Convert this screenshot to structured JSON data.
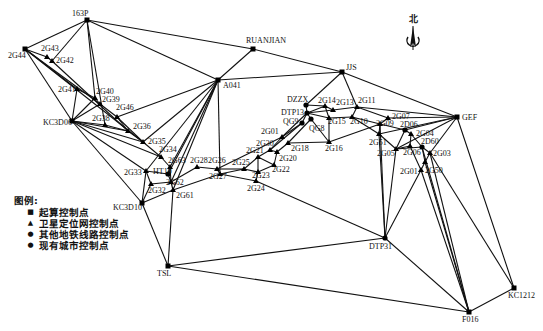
{
  "north_label": "北",
  "legend": {
    "title": "图例:",
    "items": [
      {
        "symbol": "■",
        "label": "起算控制点"
      },
      {
        "symbol": "▲",
        "label": "卫星定位网控制点"
      },
      {
        "symbol": "●",
        "label": "其他地铁线路控制点"
      },
      {
        "symbol": "●",
        "label": "现有城市控制点"
      }
    ]
  },
  "nodes": [
    {
      "id": "163P",
      "x": 87,
      "y": 20,
      "lx": 72,
      "ly": 16,
      "shape": "square"
    },
    {
      "id": "2G44",
      "x": 25,
      "y": 49,
      "lx": 8,
      "ly": 58,
      "shape": "square"
    },
    {
      "id": "2G43",
      "x": 47,
      "y": 57,
      "lx": 41,
      "ly": 51,
      "shape": "triangle"
    },
    {
      "id": "2G42",
      "x": 52,
      "y": 61,
      "lx": 56,
      "ly": 63,
      "shape": "triangle"
    },
    {
      "id": "RUANJIAN",
      "x": 253,
      "y": 49,
      "lx": 246,
      "ly": 43,
      "shape": "square"
    },
    {
      "id": "JJS",
      "x": 342,
      "y": 72,
      "lx": 346,
      "ly": 70,
      "shape": "square"
    },
    {
      "id": "A041",
      "x": 218,
      "y": 80,
      "lx": 223,
      "ly": 88,
      "shape": "square"
    },
    {
      "id": "2G41",
      "x": 77,
      "y": 89,
      "lx": 58,
      "ly": 92,
      "shape": "triangle"
    },
    {
      "id": "2G40",
      "x": 95,
      "y": 98,
      "lx": 96,
      "ly": 94,
      "shape": "triangle"
    },
    {
      "id": "2G39",
      "x": 100,
      "y": 104,
      "lx": 102,
      "ly": 102,
      "shape": "triangle"
    },
    {
      "id": "2G46",
      "x": 117,
      "y": 117,
      "lx": 116,
      "ly": 110,
      "shape": "triangle"
    },
    {
      "id": "KC3D06",
      "x": 72,
      "y": 121,
      "lx": 43,
      "ly": 125,
      "shape": "square"
    },
    {
      "id": "2G38",
      "x": 105,
      "y": 125,
      "lx": 92,
      "ly": 121,
      "shape": "triangle"
    },
    {
      "id": "2G36",
      "x": 128,
      "y": 131,
      "lx": 133,
      "ly": 129,
      "shape": "triangle"
    },
    {
      "id": "2G35",
      "x": 143,
      "y": 142,
      "lx": 148,
      "ly": 144,
      "shape": "triangle"
    },
    {
      "id": "2G34",
      "x": 161,
      "y": 157,
      "lx": 159,
      "ly": 152,
      "shape": "triangle"
    },
    {
      "id": "2G63",
      "x": 170,
      "y": 167,
      "lx": 168,
      "ly": 163,
      "shape": "triangle"
    },
    {
      "id": "2G28",
      "x": 197,
      "y": 167,
      "lx": 190,
      "ly": 163,
      "shape": "triangle"
    },
    {
      "id": "2G26",
      "x": 217,
      "y": 169,
      "lx": 208,
      "ly": 163,
      "shape": "triangle"
    },
    {
      "id": "2G33",
      "x": 146,
      "y": 171,
      "lx": 124,
      "ly": 175,
      "shape": "triangle"
    },
    {
      "id": "HT10",
      "x": 168,
      "y": 174,
      "lx": 153,
      "ly": 174,
      "shape": "circle"
    },
    {
      "id": "2G27",
      "x": 220,
      "y": 174,
      "lx": 209,
      "ly": 179,
      "shape": "triangle"
    },
    {
      "id": "2G62",
      "x": 171,
      "y": 182,
      "lx": 166,
      "ly": 185,
      "shape": "triangle"
    },
    {
      "id": "2G32",
      "x": 151,
      "y": 184,
      "lx": 148,
      "ly": 193,
      "shape": "triangle"
    },
    {
      "id": "2G61",
      "x": 173,
      "y": 190,
      "lx": 176,
      "ly": 198,
      "shape": "triangle"
    },
    {
      "id": "KC3D10",
      "x": 142,
      "y": 203,
      "lx": 113,
      "ly": 210,
      "shape": "square"
    },
    {
      "id": "2G25",
      "x": 244,
      "y": 169,
      "lx": 232,
      "ly": 165,
      "shape": "triangle"
    },
    {
      "id": "2G21",
      "x": 258,
      "y": 157,
      "lx": 246,
      "ly": 153,
      "shape": "triangle"
    },
    {
      "id": "2G30",
      "x": 270,
      "y": 150,
      "lx": 256,
      "ly": 146,
      "shape": "triangle"
    },
    {
      "id": "2G01",
      "x": 282,
      "y": 137,
      "lx": 261,
      "ly": 134,
      "shape": "triangle"
    },
    {
      "id": "2G23",
      "x": 258,
      "y": 172,
      "lx": 252,
      "ly": 178,
      "shape": "triangle"
    },
    {
      "id": "2G22",
      "x": 274,
      "y": 165,
      "lx": 272,
      "ly": 172,
      "shape": "triangle"
    },
    {
      "id": "2G20",
      "x": 277,
      "y": 152,
      "lx": 279,
      "ly": 161,
      "shape": "triangle"
    },
    {
      "id": "2G18",
      "x": 288,
      "y": 143,
      "lx": 291,
      "ly": 151,
      "shape": "triangle"
    },
    {
      "id": "2G24",
      "x": 256,
      "y": 181,
      "lx": 247,
      "ly": 191,
      "shape": "triangle"
    },
    {
      "id": "DZZX",
      "x": 306,
      "y": 105,
      "lx": 287,
      "ly": 102,
      "shape": "circle"
    },
    {
      "id": "DTP13",
      "x": 307,
      "y": 113,
      "lx": 281,
      "ly": 115,
      "shape": "circle"
    },
    {
      "id": "QG9",
      "x": 302,
      "y": 123,
      "lx": 283,
      "ly": 124,
      "shape": "circle"
    },
    {
      "id": "QG8",
      "x": 311,
      "y": 119,
      "lx": 309,
      "ly": 131,
      "shape": "circle"
    },
    {
      "id": "2G14",
      "x": 325,
      "y": 106,
      "lx": 318,
      "ly": 103,
      "shape": "triangle"
    },
    {
      "id": "2G13",
      "x": 333,
      "y": 110,
      "lx": 336,
      "ly": 105,
      "shape": "triangle"
    },
    {
      "id": "2G11",
      "x": 357,
      "y": 107,
      "lx": 358,
      "ly": 103,
      "shape": "triangle"
    },
    {
      "id": "2G15",
      "x": 329,
      "y": 118,
      "lx": 328,
      "ly": 124,
      "shape": "triangle"
    },
    {
      "id": "2G10",
      "x": 352,
      "y": 117,
      "lx": 350,
      "ly": 124,
      "shape": "triangle"
    },
    {
      "id": "2G16",
      "x": 329,
      "y": 142,
      "lx": 325,
      "ly": 151,
      "shape": "triangle"
    },
    {
      "id": "2G07",
      "x": 388,
      "y": 118,
      "lx": 392,
      "ly": 119,
      "shape": "triangle"
    },
    {
      "id": "2G09",
      "x": 380,
      "y": 124,
      "lx": 376,
      "ly": 126,
      "shape": "triangle"
    },
    {
      "id": "2D06",
      "x": 405,
      "y": 130,
      "lx": 400,
      "ly": 127,
      "shape": "circle"
    },
    {
      "id": "GEF",
      "x": 457,
      "y": 117,
      "lx": 462,
      "ly": 120,
      "shape": "square"
    },
    {
      "id": "2G04",
      "x": 411,
      "y": 134,
      "lx": 416,
      "ly": 136,
      "shape": "triangle"
    },
    {
      "id": "2D60",
      "x": 422,
      "y": 147,
      "lx": 421,
      "ly": 144,
      "shape": "circle"
    },
    {
      "id": "2G51",
      "x": 379,
      "y": 134,
      "lx": 369,
      "ly": 145,
      "shape": "triangle"
    },
    {
      "id": "2G05",
      "x": 396,
      "y": 149,
      "lx": 377,
      "ly": 156,
      "shape": "triangle"
    },
    {
      "id": "2G06",
      "x": 410,
      "y": 146,
      "lx": 403,
      "ly": 155,
      "shape": "triangle"
    },
    {
      "id": "2G03",
      "x": 430,
      "y": 153,
      "lx": 433,
      "ly": 156,
      "shape": "triangle"
    },
    {
      "id": "2G50",
      "x": 425,
      "y": 162,
      "lx": 425,
      "ly": 173,
      "shape": "triangle"
    },
    {
      "id": "2G01b",
      "label": "2G01",
      "x": 421,
      "y": 170,
      "lx": 400,
      "ly": 174,
      "shape": "triangle"
    },
    {
      "id": "DTP31",
      "x": 385,
      "y": 238,
      "lx": 369,
      "ly": 249,
      "shape": "circle"
    },
    {
      "id": "TSL",
      "x": 168,
      "y": 266,
      "lx": 157,
      "ly": 276,
      "shape": "square"
    },
    {
      "id": "KC1212",
      "x": 514,
      "y": 288,
      "lx": 508,
      "ly": 298,
      "shape": "square"
    },
    {
      "id": "F016",
      "x": 469,
      "y": 312,
      "lx": 462,
      "ly": 322,
      "shape": "square"
    }
  ],
  "edges": [
    [
      "163P",
      "2G44"
    ],
    [
      "163P",
      "2G42"
    ],
    [
      "163P",
      "2G38"
    ],
    [
      "163P",
      "2G40"
    ],
    [
      "163P",
      "A041"
    ],
    [
      "163P",
      "RUANJIAN"
    ],
    [
      "2G44",
      "2G43"
    ],
    [
      "2G43",
      "2G42"
    ],
    [
      "2G42",
      "2G36"
    ],
    [
      "2G44",
      "2G41"
    ],
    [
      "2G44",
      "KC3D06"
    ],
    [
      "2G44",
      "2G35"
    ],
    [
      "2G44",
      "2G39"
    ],
    [
      "2G41",
      "KC3D06"
    ],
    [
      "2G41",
      "2G40"
    ],
    [
      "2G40",
      "2G39"
    ],
    [
      "2G39",
      "2G46"
    ],
    [
      "2G39",
      "KC3D06"
    ],
    [
      "2G40",
      "KC3D06"
    ],
    [
      "2G46",
      "2G36"
    ],
    [
      "2G46",
      "A041"
    ],
    [
      "2G46",
      "2G35"
    ],
    [
      "KC3D06",
      "2G38"
    ],
    [
      "KC3D06",
      "2G36"
    ],
    [
      "KC3D06",
      "2G35"
    ],
    [
      "KC3D06",
      "2G33"
    ],
    [
      "KC3D06",
      "KC3D10"
    ],
    [
      "KC3D06",
      "2G34"
    ],
    [
      "2G38",
      "2G36"
    ],
    [
      "2G36",
      "2G35"
    ],
    [
      "2G35",
      "2G34"
    ],
    [
      "2G34",
      "2G63"
    ],
    [
      "2G35",
      "A041"
    ],
    [
      "2G63",
      "HT10"
    ],
    [
      "2G63",
      "2G62"
    ],
    [
      "2G33",
      "HT10"
    ],
    [
      "2G33",
      "2G32"
    ],
    [
      "2G33",
      "KC3D10"
    ],
    [
      "2G32",
      "2G62"
    ],
    [
      "HT10",
      "2G62"
    ],
    [
      "2G62",
      "2G61"
    ],
    [
      "KC3D10",
      "2G61"
    ],
    [
      "2G32",
      "KC3D10"
    ],
    [
      "KC3D10",
      "TSL"
    ],
    [
      "2G61",
      "TSL"
    ],
    [
      "A041",
      "2G63"
    ],
    [
      "A041",
      "HT10"
    ],
    [
      "A041",
      "2G62"
    ],
    [
      "A041",
      "2G61"
    ],
    [
      "A041",
      "2G33"
    ],
    [
      "A041",
      "2G27"
    ],
    [
      "A041",
      "RUANJIAN"
    ],
    [
      "A041",
      "JJS"
    ],
    [
      "RUANJIAN",
      "JJS"
    ],
    [
      "JJS",
      "DZZX"
    ],
    [
      "JJS",
      "2G11"
    ],
    [
      "JJS",
      "GEF"
    ],
    [
      "2G28",
      "2G26"
    ],
    [
      "2G26",
      "2G27"
    ],
    [
      "2G28",
      "2G62"
    ],
    [
      "2G27",
      "2G61"
    ],
    [
      "2G26",
      "2G25"
    ],
    [
      "2G27",
      "2G24"
    ],
    [
      "2G27",
      "2G25"
    ],
    [
      "2G25",
      "2G21"
    ],
    [
      "2G25",
      "2G23"
    ],
    [
      "2G21",
      "2G30"
    ],
    [
      "2G30",
      "2G01"
    ],
    [
      "2G21",
      "2G23"
    ],
    [
      "2G21",
      "2G22"
    ],
    [
      "2G23",
      "2G22"
    ],
    [
      "2G22",
      "2G20"
    ],
    [
      "2G20",
      "2G30"
    ],
    [
      "2G20",
      "2G18"
    ],
    [
      "2G23",
      "2G24"
    ],
    [
      "2G24",
      "DTP31"
    ],
    [
      "2G26",
      "2G01"
    ],
    [
      "2G01",
      "DTP13"
    ],
    [
      "2G01",
      "QG9"
    ],
    [
      "2G18",
      "QG8"
    ],
    [
      "2G18",
      "2G16"
    ],
    [
      "2G30",
      "QG9"
    ],
    [
      "DZZX",
      "DTP13"
    ],
    [
      "DTP13",
      "QG9"
    ],
    [
      "DTP13",
      "QG8"
    ],
    [
      "DZZX",
      "2G14"
    ],
    [
      "DTP13",
      "2G14"
    ],
    [
      "DTP13",
      "2G13"
    ],
    [
      "DTP13",
      "2G15"
    ],
    [
      "2G14",
      "2G13"
    ],
    [
      "2G14",
      "2G15"
    ],
    [
      "2G13",
      "2G11"
    ],
    [
      "2G15",
      "2G10"
    ],
    [
      "QG8",
      "2G16"
    ],
    [
      "2G15",
      "2G16"
    ],
    [
      "2G11",
      "2G10"
    ],
    [
      "2G11",
      "2G07"
    ],
    [
      "2G11",
      "GEF"
    ],
    [
      "2G10",
      "2G09"
    ],
    [
      "2G10",
      "2G51"
    ],
    [
      "2G16",
      "2G09"
    ],
    [
      "2G07",
      "2G09"
    ],
    [
      "2G07",
      "GEF"
    ],
    [
      "2G09",
      "2D06"
    ],
    [
      "2G09",
      "2G51"
    ],
    [
      "2D06",
      "GEF"
    ],
    [
      "2D06",
      "2G05"
    ],
    [
      "2D06",
      "2G04"
    ],
    [
      "2G51",
      "2G05"
    ],
    [
      "2G51",
      "GEF"
    ],
    [
      "2G51",
      "DTP31"
    ],
    [
      "2G05",
      "2G06"
    ],
    [
      "2G05",
      "2D60"
    ],
    [
      "2G05",
      "DTP31"
    ],
    [
      "2G05",
      "GEF"
    ],
    [
      "2G04",
      "2G06"
    ],
    [
      "2G04",
      "2D60"
    ],
    [
      "2D60",
      "2G03"
    ],
    [
      "2D60",
      "2G50"
    ],
    [
      "2G06",
      "2G01b"
    ],
    [
      "2G03",
      "2G50"
    ],
    [
      "2G03",
      "GEF"
    ],
    [
      "2G50",
      "2G01b"
    ],
    [
      "2G01b",
      "DTP31"
    ],
    [
      "2G01b",
      "F016"
    ],
    [
      "2G50",
      "F016"
    ],
    [
      "2G03",
      "F016"
    ],
    [
      "2G03",
      "KC1212"
    ],
    [
      "GEF",
      "KC1212"
    ],
    [
      "2D60",
      "F016"
    ],
    [
      "DTP31",
      "F016"
    ],
    [
      "TSL",
      "DTP31"
    ],
    [
      "TSL",
      "F016"
    ],
    [
      "F016",
      "KC1212"
    ],
    [
      "DTP31",
      "2G09"
    ]
  ]
}
